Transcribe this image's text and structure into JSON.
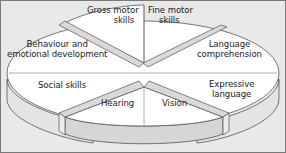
{
  "diagram": {
    "type": "3d-pie",
    "segments": [
      {
        "id": "gross-motor",
        "label_line1": "Gross motor",
        "label_line2": "skills"
      },
      {
        "id": "fine-motor",
        "label_line1": "Fine motor",
        "label_line2": "skills"
      },
      {
        "id": "language-comprehension",
        "label_line1": "Language",
        "label_line2": "comprehension"
      },
      {
        "id": "expressive-language",
        "label_line1": "Expressive",
        "label_line2": "language"
      },
      {
        "id": "vision",
        "label_line1": "Vision",
        "label_line2": ""
      },
      {
        "id": "hearing",
        "label_line1": "Hearing",
        "label_line2": ""
      },
      {
        "id": "social-skills",
        "label_line1": "Social skills",
        "label_line2": ""
      },
      {
        "id": "behaviour",
        "label_line1": "Behaviour and",
        "label_line2": "emotional development"
      }
    ],
    "colors": {
      "background": "#e9e9e9",
      "top_face": "#ffffff",
      "side_face": "#e2e2e2",
      "pulled_side": "#d4d4d4",
      "outline": "#555555",
      "frame": "#7a7a7a"
    }
  }
}
